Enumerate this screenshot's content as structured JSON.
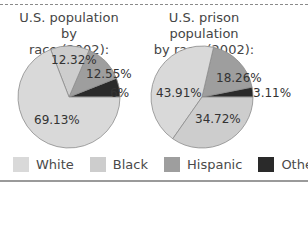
{
  "legend": {
    "items": [
      {
        "label": "White",
        "color": "#d9d9d9"
      },
      {
        "label": "Black",
        "color": "#cdcdcd"
      },
      {
        "label": "Hispanic",
        "color": "#9e9e9e"
      },
      {
        "label": "Other",
        "color": "#2a2a2a"
      }
    ]
  },
  "charts": {
    "left": {
      "title_line1": "U.S. population by",
      "title_line2": "race (2002):"
    },
    "right": {
      "title_line1": "U.S. prison population",
      "title_line2": "by race (2002):"
    }
  },
  "chart_data": [
    {
      "type": "pie",
      "title": "U.S. population by race (2002):",
      "categories": [
        "White",
        "Black",
        "Hispanic",
        "Other"
      ],
      "values": [
        69.13,
        12.32,
        12.55,
        6
      ],
      "labels": [
        "69.13%",
        "12.32%",
        "12.55%",
        "6%"
      ],
      "colors": [
        "#d9d9d9",
        "#cdcdcd",
        "#9e9e9e",
        "#2a2a2a"
      ],
      "slice_order_ccw_from_east": [
        "Other",
        "Hispanic",
        "Black",
        "White"
      ]
    },
    {
      "type": "pie",
      "title": "U.S. prison population by race (2002):",
      "categories": [
        "White",
        "Black",
        "Hispanic",
        "Other"
      ],
      "values": [
        43.91,
        34.72,
        18.26,
        3.11
      ],
      "labels": [
        "43.91%",
        "34.72%",
        "18.26%",
        "3.11%"
      ],
      "colors": [
        "#d9d9d9",
        "#cdcdcd",
        "#9e9e9e",
        "#2a2a2a"
      ],
      "slice_order_ccw_from_east": [
        "Other",
        "Hispanic",
        "White",
        "Black"
      ]
    }
  ]
}
